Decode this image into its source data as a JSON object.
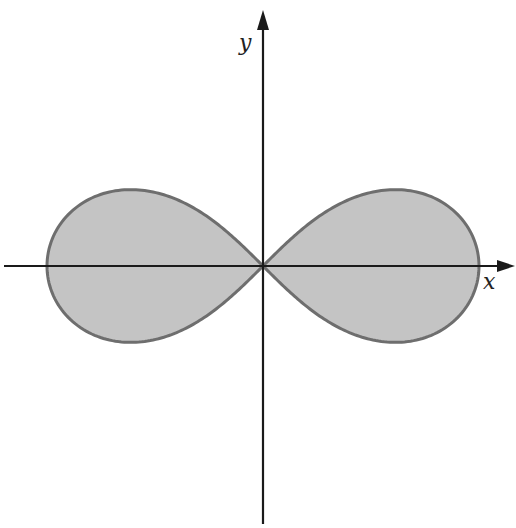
{
  "diagram": {
    "type": "lemniscate-region",
    "axes": {
      "x_label": "x",
      "y_label": "y"
    },
    "colors": {
      "fill": "#c4c4c4",
      "curve_stroke": "#6e6e6e",
      "axis": "#1a1a1a",
      "background": "#ffffff"
    },
    "geometry": {
      "origin_px": [
        263,
        266
      ],
      "lobe_half_width_px": 216,
      "axis_x_range_px": [
        4,
        515
      ],
      "axis_y_range_px": [
        10,
        524
      ]
    }
  }
}
